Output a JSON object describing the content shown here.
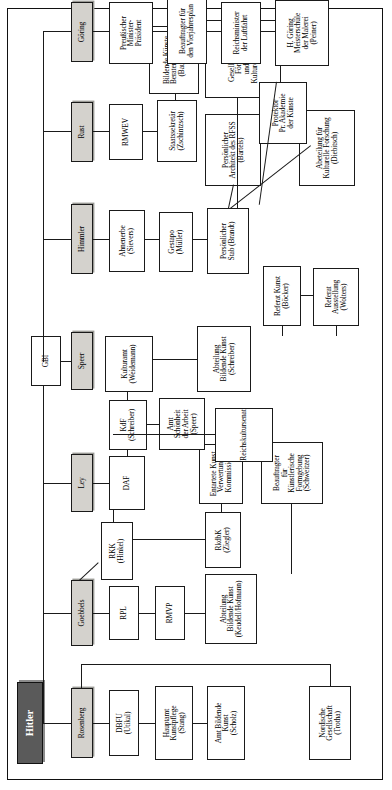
{
  "chart": {
    "title": "Hitler",
    "type": "organizational-hierarchy",
    "orientation": "rotated-90-ccw",
    "root": {
      "label": "Hitler",
      "style": "dark"
    },
    "ministers": [
      {
        "id": "rosenberg",
        "label": "Rosenberg"
      },
      {
        "id": "goebbels",
        "label": "Goebbels"
      },
      {
        "id": "ley",
        "label": "Ley"
      },
      {
        "id": "speer",
        "label": "Speer"
      },
      {
        "id": "himmler",
        "label": "Himmler"
      },
      {
        "id": "rust",
        "label": "Rust"
      },
      {
        "id": "goering",
        "label": "Göring"
      }
    ],
    "nodes": [
      {
        "id": "dbfu",
        "label": "DBFU\n(Utikal)"
      },
      {
        "id": "hauptamt",
        "label": "Hauptamt\nKunstpflege\n(Stang)"
      },
      {
        "id": "amtbild",
        "label": "Amt Bildende\nKunst\n(Scholz)"
      },
      {
        "id": "nordische",
        "label": "Nordische\nGesellschaft\n(Trotha)"
      },
      {
        "id": "rpl",
        "label": "RPL"
      },
      {
        "id": "rmvp",
        "label": "RMVP"
      },
      {
        "id": "rkk",
        "label": "RKK\n(Hinkel)"
      },
      {
        "id": "abtbkkeudell",
        "label": "Abteilung\nBildende Kunst\n(Keudell/Hofmann)"
      },
      {
        "id": "rkdbk",
        "label": "RkdbK\n(Ziegler)"
      },
      {
        "id": "entartete",
        "label": "Entartete Kunst\nVerwertungs\nKommission"
      },
      {
        "id": "schweitzer",
        "label": "Beauftragter\nfür\nKünstlerische\nFormgebung\n(Schweitzer)"
      },
      {
        "id": "daf",
        "label": "DAF"
      },
      {
        "id": "kdf",
        "label": "KdF\n(Schreiber)"
      },
      {
        "id": "amtschoen",
        "label": "Amt\nSchönheit\nder Arbeit\n(Speer)"
      },
      {
        "id": "kulturamt",
        "label": "Kulturamt\n(Weidemann)"
      },
      {
        "id": "reichskultur",
        "label": "Reichskultursenat"
      },
      {
        "id": "abtbkschreib",
        "label": "Abteilung\nBildende Kunst\n(Schreiber)"
      },
      {
        "id": "gbi",
        "label": "GBI"
      },
      {
        "id": "ahnenerbe",
        "label": "Ahnenerbe\n(Sievers)"
      },
      {
        "id": "gestapo",
        "label": "Gestapo\n(Müller)"
      },
      {
        "id": "persstab",
        "label": "Persönlicher\nStab (Brandt)"
      },
      {
        "id": "referatkunst",
        "label": "Referat Kunst\n(Böcker)"
      },
      {
        "id": "referataus",
        "label": "Referat\nAusstellung\n(Wolters)"
      },
      {
        "id": "abtkultforsch",
        "label": "Abeteilung für\nKulturelle Forschung\n(Diebitsch)"
      },
      {
        "id": "bartels",
        "label": "Persönlicher\nArchitekt des RFSS\n(Bartels)"
      },
      {
        "id": "gesellschaft",
        "label": "Gesellschaft zur Förderung\nund Pflege Kulturdenkmäler"
      },
      {
        "id": "rmwev",
        "label": "RMWEV"
      },
      {
        "id": "staatssek",
        "label": "Staatssekretär\n(Zschintzsch)"
      },
      {
        "id": "baudissin",
        "label": "Bildende Künste\nBerater (adviser)\n(Baudissin)"
      },
      {
        "id": "preuss",
        "label": "Preußischer\nMinister-\nPräsident"
      },
      {
        "id": "vierjahres",
        "label": "Beauftragter für\nden Vierjahresplan"
      },
      {
        "id": "luftfahrt",
        "label": "Reichsminister\nder Luftfahrt"
      },
      {
        "id": "peiner",
        "label": "H. Göring\nMeisterschule\nder Malerei\n(Peiner)"
      },
      {
        "id": "protektor",
        "label": "Protektor\nPr. Akademie\nder Künste"
      }
    ],
    "colors": {
      "root_fill": "#5a5a5a",
      "minister_fill": "#d4d2cd",
      "node_fill": "#ffffff",
      "line": "#1a1a1a",
      "frame": "#111111"
    }
  }
}
